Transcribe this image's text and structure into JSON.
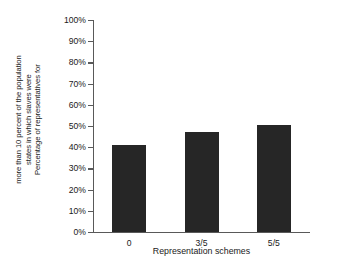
{
  "chart_data": {
    "type": "bar",
    "title": "",
    "subtitle": "",
    "categories": [
      "0",
      "3/5",
      "5/5"
    ],
    "values": [
      41,
      47,
      50.5
    ],
    "series": [
      {
        "name": "Percentage of representatives",
        "values": [
          41,
          47,
          50.5
        ]
      }
    ],
    "xlabel": "Representation schemes",
    "ylabel": "Percentage of representatives for states in which slaves were more than 10 percent of the population",
    "ylabel_lines": [
      "Percentage of representatives for",
      "states in which slaves were",
      "more than 10 percent of the population"
    ],
    "ylim": [
      0,
      100
    ],
    "ytick_labels": [
      "0%",
      "10%",
      "20%",
      "30%",
      "40%",
      "50%",
      "60%",
      "70%",
      "80%",
      "90%",
      "100%"
    ],
    "ytick_values": [
      0,
      10,
      20,
      30,
      40,
      50,
      60,
      70,
      80,
      90,
      100
    ],
    "grid": false,
    "legend": false,
    "legend_position": "none",
    "bar_color": "#262626",
    "axis_color": "#595959",
    "text_color": "#1a1a1a",
    "background_color": "#ffffff"
  }
}
